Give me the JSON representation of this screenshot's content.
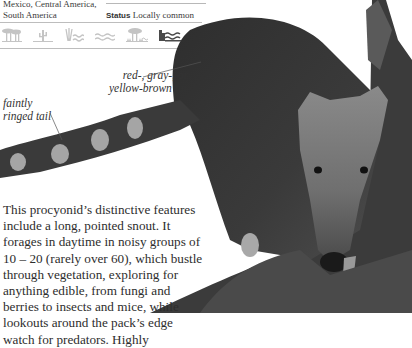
{
  "page": {
    "species": "coati",
    "range_text": "Mexico, Central America, South America",
    "range_lines": [
      "Mexico, Central America,",
      "South America"
    ],
    "status_label": "Status",
    "status_value": "Locally common",
    "habitat_icons": [
      {
        "name": "woodland-icon",
        "active": false
      },
      {
        "name": "desert-icon",
        "active": false
      },
      {
        "name": "wetland-icon",
        "active": false
      },
      {
        "name": "water-icon",
        "active": false
      },
      {
        "name": "rainforest-icon",
        "active": false
      },
      {
        "name": "coastal-mangrove-icon",
        "active": true
      }
    ],
    "colors": {
      "inactive_icon": "#c4c4c4",
      "active_icon": "#4a4a4a",
      "rule": "#bdbdbd",
      "text": "#2d2d2d"
    }
  },
  "annotations": {
    "fur": [
      "red-, gray-, or",
      "yellow-brown fur"
    ],
    "tail": [
      "faintly",
      "ringed tail"
    ]
  },
  "body_text": {
    "lines": [
      "This procyonid’s distinctive features",
      "include a long, pointed snout. It",
      "forages in daytime in noisy groups of",
      "10 – 20 (rarely over 60), which bustle",
      "through vegetation, exploring for",
      "anything edible, from fungi and",
      "berries to insects and mice, while",
      "lookouts around the pack’s edge",
      "watch for predators. Highly"
    ]
  },
  "photo": {
    "subject": "coati on tree trunk",
    "alt": "Photograph of a coati with ringed tail climbing down a tree trunk"
  }
}
